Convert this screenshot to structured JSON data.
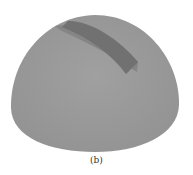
{
  "figure": {
    "caption": "(b)",
    "colors": {
      "background": "#ffffff",
      "dome": "#999999",
      "slot_dark": "#707070",
      "slot_edge": "#858585",
      "caption": "#333333"
    }
  }
}
